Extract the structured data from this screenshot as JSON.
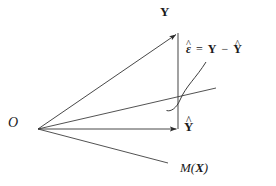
{
  "figure": {
    "background_color": "#ffffff",
    "line_color": "#333333",
    "text_color": "#1a1a1a",
    "width": 276,
    "height": 186
  },
  "labels": {
    "origin": "O",
    "y_vector": "Y",
    "y_hat_base": "Y",
    "y_hat_accent": "^",
    "residual_eps": "ε",
    "residual_accent": "^",
    "equals": "=",
    "minus": "−",
    "eq_term_y": "Y",
    "eq_term_yhat_base": "Y",
    "eq_term_yhat_accent": "^",
    "subspace_m": "M",
    "subspace_open_paren": "(",
    "subspace_x": "X",
    "subspace_close_paren": ")"
  },
  "geometry": {
    "origin_point": [
      38,
      129
    ],
    "y_tip": [
      178,
      33
    ],
    "y_hat_tip": [
      178,
      129
    ],
    "plane_upper_edge_end": [
      216,
      88
    ],
    "plane_lower_edge_end": [
      168,
      163
    ],
    "curve_start": [
      168,
      108
    ],
    "curve_end": [
      206,
      62
    ]
  }
}
